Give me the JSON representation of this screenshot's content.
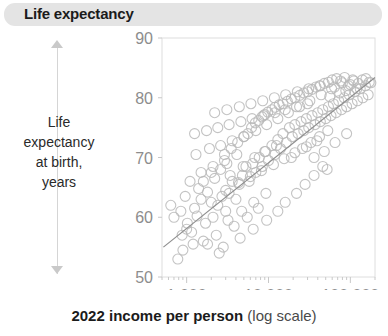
{
  "header": {
    "title": "Life expectancy"
  },
  "axis_annotation": {
    "caption": "Life expectancy at birth, years",
    "caption_lines": [
      "Life",
      "expectancy",
      "at birth,",
      "years"
    ],
    "up_arrow_icon": "arrow-up-icon",
    "down_arrow_icon": "arrow-down-icon"
  },
  "x_axis_title": {
    "bold_part": "2022 income per person",
    "light_part": "(log scale)"
  },
  "chart_data": {
    "type": "scatter",
    "title": "Life expectancy",
    "xlabel": "2022 income per person (log scale)",
    "ylabel": "Life expectancy at birth, years",
    "xscale": "log",
    "xlim": [
      500,
      200000
    ],
    "ylim": [
      50,
      90
    ],
    "xticks": [
      1000,
      10000,
      100000
    ],
    "xtick_labels": [
      "1,000",
      "10,000",
      "100,000"
    ],
    "yticks": [
      50,
      60,
      70,
      80,
      90
    ],
    "ytick_labels": [
      "50",
      "60",
      "70",
      "80",
      "90"
    ],
    "grid": false,
    "legend": "none",
    "point_color": "#b9b9b9",
    "line_color": "#8e8e8e",
    "marker": "open-circle",
    "marker_size": 5,
    "trendline": {
      "type": "linear-on-log-x",
      "x": [
        520,
        200000
      ],
      "y": [
        55.0,
        83.4
      ]
    },
    "series": [
      {
        "name": "Countries",
        "points": [
          [
            780,
            53.0
          ],
          [
            900,
            54.5
          ],
          [
            1020,
            59.0
          ],
          [
            640,
            62.0
          ],
          [
            1150,
            57.5
          ],
          [
            1340,
            60.2
          ],
          [
            1500,
            63.0
          ],
          [
            880,
            57.0
          ],
          [
            1700,
            59.0
          ],
          [
            1250,
            61.5
          ],
          [
            960,
            63.5
          ],
          [
            2100,
            60.0
          ],
          [
            1800,
            64.2
          ],
          [
            2400,
            62.0
          ],
          [
            1600,
            66.0
          ],
          [
            2700,
            63.5
          ],
          [
            2200,
            66.5
          ],
          [
            3000,
            61.0
          ],
          [
            1400,
            64.8
          ],
          [
            3300,
            64.0
          ],
          [
            2600,
            68.0
          ],
          [
            3600,
            66.0
          ],
          [
            2000,
            67.5
          ],
          [
            4000,
            63.0
          ],
          [
            4400,
            65.5
          ],
          [
            3100,
            69.0
          ],
          [
            4800,
            67.0
          ],
          [
            2900,
            70.5
          ],
          [
            5300,
            68.5
          ],
          [
            5800,
            66.0
          ],
          [
            3500,
            71.5
          ],
          [
            6400,
            69.0
          ],
          [
            7000,
            67.5
          ],
          [
            4200,
            72.5
          ],
          [
            7700,
            70.0
          ],
          [
            8400,
            68.5
          ],
          [
            5000,
            73.5
          ],
          [
            9200,
            71.0
          ],
          [
            10000,
            69.5
          ],
          [
            5600,
            74.0
          ],
          [
            11000,
            72.0
          ],
          [
            12000,
            70.5
          ],
          [
            6200,
            75.0
          ],
          [
            13000,
            73.0
          ],
          [
            14000,
            71.5
          ],
          [
            6900,
            75.8
          ],
          [
            15000,
            74.0
          ],
          [
            16500,
            72.5
          ],
          [
            7600,
            76.2
          ],
          [
            18000,
            75.0
          ],
          [
            19500,
            73.5
          ],
          [
            8300,
            76.8
          ],
          [
            21000,
            75.5
          ],
          [
            23000,
            74.0
          ],
          [
            9000,
            77.2
          ],
          [
            25000,
            76.0
          ],
          [
            27000,
            74.5
          ],
          [
            9800,
            77.6
          ],
          [
            29000,
            76.5
          ],
          [
            31000,
            75.0
          ],
          [
            11000,
            78.0
          ],
          [
            34000,
            77.0
          ],
          [
            37000,
            75.5
          ],
          [
            12000,
            78.4
          ],
          [
            40000,
            77.5
          ],
          [
            43000,
            76.0
          ],
          [
            13500,
            78.8
          ],
          [
            46000,
            78.0
          ],
          [
            50000,
            76.5
          ],
          [
            15000,
            79.0
          ],
          [
            54000,
            78.5
          ],
          [
            58000,
            77.0
          ],
          [
            17000,
            79.4
          ],
          [
            62000,
            79.0
          ],
          [
            67000,
            77.5
          ],
          [
            19000,
            79.8
          ],
          [
            72000,
            79.5
          ],
          [
            78000,
            78.0
          ],
          [
            21000,
            80.0
          ],
          [
            84000,
            80.0
          ],
          [
            90000,
            78.5
          ],
          [
            24000,
            80.4
          ],
          [
            97000,
            80.5
          ],
          [
            105000,
            79.0
          ],
          [
            27000,
            80.8
          ],
          [
            113000,
            81.0
          ],
          [
            122000,
            79.5
          ],
          [
            30000,
            81.0
          ],
          [
            132000,
            81.5
          ],
          [
            142000,
            80.0
          ],
          [
            34000,
            81.4
          ],
          [
            153000,
            82.0
          ],
          [
            165000,
            80.5
          ],
          [
            38000,
            81.8
          ],
          [
            178000,
            82.5
          ],
          [
            43000,
            82.0
          ],
          [
            48000,
            82.4
          ],
          [
            54000,
            82.6
          ],
          [
            60000,
            83.0
          ],
          [
            68000,
            83.2
          ],
          [
            76000,
            82.8
          ],
          [
            85000,
            83.4
          ],
          [
            95000,
            82.0
          ],
          [
            107000,
            83.0
          ],
          [
            120000,
            81.5
          ],
          [
            1800,
            55.5
          ],
          [
            2300,
            57.0
          ],
          [
            3800,
            58.5
          ],
          [
            5500,
            60.0
          ],
          [
            7500,
            61.5
          ],
          [
            2800,
            55.0
          ],
          [
            4500,
            56.5
          ],
          [
            6500,
            58.0
          ],
          [
            9500,
            59.5
          ],
          [
            13000,
            61.0
          ],
          [
            3400,
            67.0
          ],
          [
            4900,
            68.5
          ],
          [
            6800,
            70.0
          ],
          [
            9000,
            71.0
          ],
          [
            12500,
            72.0
          ],
          [
            1100,
            66.0
          ],
          [
            1500,
            67.5
          ],
          [
            2100,
            68.5
          ],
          [
            2900,
            69.5
          ],
          [
            4100,
            70.5
          ],
          [
            16000,
            62.5
          ],
          [
            22000,
            64.0
          ],
          [
            28000,
            65.5
          ],
          [
            36000,
            67.0
          ],
          [
            46000,
            68.5
          ],
          [
            19000,
            70.0
          ],
          [
            26000,
            71.5
          ],
          [
            33000,
            72.5
          ],
          [
            42000,
            73.5
          ],
          [
            53000,
            74.5
          ],
          [
            1300,
            70.5
          ],
          [
            1900,
            71.5
          ],
          [
            2600,
            72.0
          ],
          [
            3600,
            72.8
          ],
          [
            5000,
            73.5
          ],
          [
            7000,
            74.5
          ],
          [
            9500,
            75.5
          ],
          [
            13000,
            76.5
          ],
          [
            17500,
            77.5
          ],
          [
            24000,
            78.5
          ],
          [
            32000,
            79.5
          ],
          [
            44000,
            80.5
          ],
          [
            59000,
            81.5
          ],
          [
            80000,
            82.5
          ],
          [
            1250,
            74.0
          ],
          [
            1750,
            74.5
          ],
          [
            2400,
            75.0
          ],
          [
            3300,
            75.5
          ],
          [
            4600,
            76.0
          ],
          [
            6300,
            76.5
          ],
          [
            8700,
            77.0
          ],
          [
            12000,
            77.5
          ],
          [
            16000,
            78.0
          ],
          [
            22000,
            78.5
          ],
          [
            30000,
            79.0
          ],
          [
            2000,
            62.5
          ],
          [
            3000,
            64.5
          ],
          [
            4300,
            65.8
          ],
          [
            6000,
            66.8
          ],
          [
            8200,
            67.8
          ],
          [
            11500,
            68.8
          ],
          [
            15500,
            69.8
          ],
          [
            21000,
            70.8
          ],
          [
            29000,
            71.8
          ],
          [
            39000,
            72.8
          ],
          [
            700,
            60.0
          ],
          [
            850,
            61.0
          ],
          [
            1000,
            58.0
          ],
          [
            1200,
            55.5
          ],
          [
            1600,
            56.0
          ],
          [
            2500,
            54.0
          ],
          [
            3200,
            59.5
          ],
          [
            4700,
            61.0
          ],
          [
            6600,
            62.5
          ],
          [
            9300,
            64.0
          ],
          [
            56000,
            80.2
          ],
          [
            64000,
            81.8
          ],
          [
            74000,
            80.8
          ],
          [
            88000,
            81.2
          ],
          [
            100000,
            82.2
          ],
          [
            110000,
            82.8
          ],
          [
            125000,
            82.4
          ],
          [
            140000,
            83.0
          ],
          [
            155000,
            83.2
          ],
          [
            170000,
            82.6
          ],
          [
            36000,
            70.0
          ],
          [
            48000,
            71.0
          ],
          [
            65000,
            72.5
          ],
          [
            90000,
            74.0
          ],
          [
            52000,
            68.0
          ],
          [
            2200,
            77.5
          ],
          [
            3100,
            78.0
          ],
          [
            4400,
            78.5
          ],
          [
            6100,
            79.0
          ],
          [
            8500,
            79.5
          ],
          [
            11800,
            80.0
          ],
          [
            16200,
            80.5
          ],
          [
            22500,
            81.0
          ],
          [
            31000,
            81.5
          ],
          [
            42000,
            82.0
          ]
        ]
      }
    ]
  }
}
